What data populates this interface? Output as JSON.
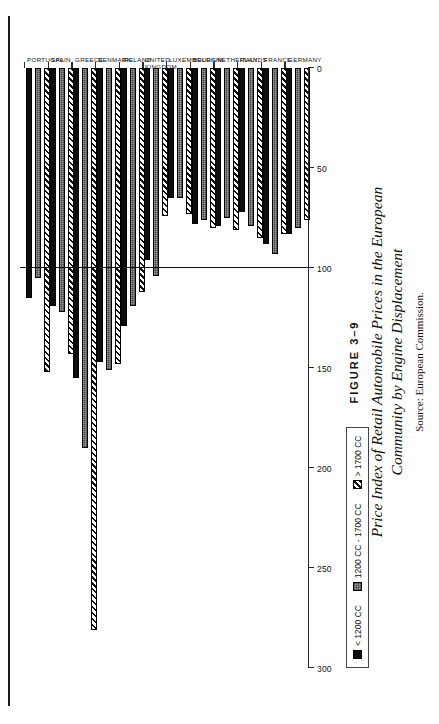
{
  "figure": {
    "number": "FIGURE 3–9",
    "title_line1": "Price Index of Retail Automobile Prices in the European",
    "title_line2": "Community by Engine Displacement",
    "source": "Source: European Commission."
  },
  "legend": {
    "items": [
      {
        "label": "< 1200 CC",
        "pattern": "solid",
        "color": "#0d0d0d"
      },
      {
        "label": "1200 CC - 1700 CC",
        "pattern": "dots",
        "color": "#9a9a9a"
      },
      {
        "label": "> 1700 CC",
        "pattern": "hatch",
        "color": "#ffffff"
      }
    ]
  },
  "chart_data": {
    "type": "bar",
    "orientation": "horizontal",
    "title": "Price Index of Retail Automobile Prices in the European Community by Engine Displacement",
    "xlabel": "",
    "ylabel": "",
    "xlim": [
      0,
      300
    ],
    "xticks": [
      0,
      50,
      100,
      150,
      200,
      250,
      300
    ],
    "xtick_labels": [
      "0",
      "50",
      "100",
      "150",
      "200",
      "250",
      "300"
    ],
    "grid": false,
    "reference_line": 100,
    "legend_position": "top-left",
    "categories": [
      "GERMANY",
      "FRANCE",
      "ITALY",
      "NETHERLANDS",
      "BELGIUM",
      "LUXEMBOURG",
      "UNITED KINGDOM",
      "IRELAND",
      "DENMARK",
      "GREECE",
      "SPAIN",
      "PORTUGAL"
    ],
    "series": [
      {
        "name": "< 1200 CC",
        "values": [
          83,
          88,
          72,
          79,
          78,
          65,
          96,
          129,
          147,
          155,
          119,
          115
        ]
      },
      {
        "name": "1200 CC - 1700 CC",
        "values": [
          80,
          93,
          79,
          75,
          76,
          65,
          104,
          119,
          151,
          190,
          122,
          105
        ]
      },
      {
        "name": "> 1700 CC",
        "values": [
          76,
          83,
          85,
          81,
          80,
          73,
          74,
          112,
          148,
          281,
          143,
          152
        ]
      }
    ]
  },
  "axis": {
    "tick_labels": [
      "300",
      "250",
      "200",
      "150",
      "100",
      "50",
      "0"
    ]
  }
}
